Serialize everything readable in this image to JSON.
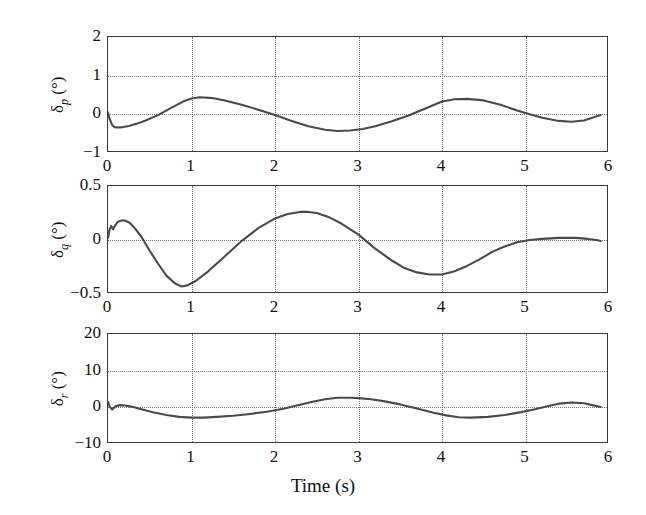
{
  "figure": {
    "background_color": "#ffffff",
    "line_color": "#4a4a4a",
    "axis_color": "#3a3a3a",
    "grid_color": "#777777",
    "xlabel": "Time (s)"
  },
  "chart_data": [
    {
      "type": "line",
      "title": "",
      "xlabel": "",
      "ylabel": "δ_p (°)",
      "ylabel_symbol": "δ",
      "ylabel_subscript": "p",
      "ylabel_unit": "(°)",
      "xlim": [
        0,
        6
      ],
      "ylim": [
        -1,
        2
      ],
      "xticks": [
        0,
        1,
        2,
        3,
        4,
        5,
        6
      ],
      "yticks": [
        -1,
        0,
        1,
        2
      ],
      "xticklabels": [
        "0",
        "1",
        "2",
        "3",
        "4",
        "5",
        "6"
      ],
      "yticklabels": [
        "-1",
        "0",
        "1",
        "2"
      ],
      "grid": true,
      "legend": false,
      "series": [
        {
          "name": "δ_p",
          "x": [
            0.0,
            0.02,
            0.05,
            0.08,
            0.12,
            0.18,
            0.25,
            0.35,
            0.45,
            0.6,
            0.75,
            0.9,
            1.0,
            1.1,
            1.25,
            1.4,
            1.6,
            1.8,
            2.0,
            2.2,
            2.4,
            2.6,
            2.75,
            2.9,
            3.05,
            3.2,
            3.4,
            3.6,
            3.8,
            4.0,
            4.15,
            4.3,
            4.5,
            4.7,
            4.9,
            5.05,
            5.2,
            5.4,
            5.55,
            5.7,
            5.8,
            5.9
          ],
          "y": [
            0.05,
            -0.12,
            -0.28,
            -0.33,
            -0.34,
            -0.33,
            -0.3,
            -0.24,
            -0.16,
            -0.02,
            0.16,
            0.33,
            0.41,
            0.44,
            0.42,
            0.36,
            0.25,
            0.12,
            -0.02,
            -0.17,
            -0.31,
            -0.4,
            -0.43,
            -0.42,
            -0.38,
            -0.31,
            -0.18,
            -0.03,
            0.15,
            0.33,
            0.39,
            0.4,
            0.36,
            0.25,
            0.1,
            0.0,
            -0.09,
            -0.17,
            -0.19,
            -0.16,
            -0.09,
            -0.02
          ]
        }
      ]
    },
    {
      "type": "line",
      "title": "",
      "xlabel": "",
      "ylabel": "δ_q (°)",
      "ylabel_symbol": "δ",
      "ylabel_subscript": "q",
      "ylabel_unit": "(°)",
      "xlim": [
        0,
        6
      ],
      "ylim": [
        -0.5,
        0.5
      ],
      "xticks": [
        0,
        1,
        2,
        3,
        4,
        5,
        6
      ],
      "yticks": [
        -0.5,
        0,
        0.5
      ],
      "xticklabels": [
        "0",
        "1",
        "2",
        "3",
        "4",
        "5",
        "6"
      ],
      "yticklabels": [
        "-0.5",
        "0",
        "0.5"
      ],
      "grid": true,
      "legend": false,
      "series": [
        {
          "name": "δ_q",
          "x": [
            0.0,
            0.02,
            0.04,
            0.06,
            0.09,
            0.12,
            0.16,
            0.2,
            0.26,
            0.32,
            0.4,
            0.5,
            0.6,
            0.7,
            0.8,
            0.88,
            0.95,
            1.05,
            1.2,
            1.4,
            1.6,
            1.8,
            2.0,
            2.15,
            2.3,
            2.4,
            2.5,
            2.65,
            2.8,
            3.0,
            3.2,
            3.4,
            3.55,
            3.7,
            3.85,
            4.0,
            4.15,
            4.3,
            4.45,
            4.6,
            4.75,
            4.9,
            5.05,
            5.2,
            5.4,
            5.6,
            5.75,
            5.85,
            5.9
          ],
          "y": [
            0.02,
            0.1,
            0.13,
            0.1,
            0.14,
            0.17,
            0.18,
            0.18,
            0.16,
            0.11,
            0.03,
            -0.1,
            -0.22,
            -0.33,
            -0.4,
            -0.43,
            -0.42,
            -0.38,
            -0.29,
            -0.15,
            -0.01,
            0.11,
            0.2,
            0.24,
            0.26,
            0.26,
            0.25,
            0.21,
            0.15,
            0.05,
            -0.08,
            -0.19,
            -0.26,
            -0.3,
            -0.32,
            -0.32,
            -0.29,
            -0.24,
            -0.18,
            -0.11,
            -0.06,
            -0.02,
            0.0,
            0.01,
            0.02,
            0.02,
            0.01,
            0.0,
            -0.01
          ]
        }
      ]
    },
    {
      "type": "line",
      "title": "",
      "xlabel": "Time (s)",
      "ylabel": "δ_r (°)",
      "ylabel_symbol": "δ",
      "ylabel_subscript": "r",
      "ylabel_unit": "(°)",
      "xlim": [
        0,
        6
      ],
      "ylim": [
        -10,
        20
      ],
      "xticks": [
        0,
        1,
        2,
        3,
        4,
        5,
        6
      ],
      "yticks": [
        -10,
        0,
        10,
        20
      ],
      "xticklabels": [
        "0",
        "1",
        "2",
        "3",
        "4",
        "5",
        "6"
      ],
      "yticklabels": [
        "-10",
        "0",
        "10",
        "20"
      ],
      "grid": true,
      "legend": false,
      "series": [
        {
          "name": "δ_r",
          "x": [
            0.0,
            0.02,
            0.05,
            0.09,
            0.14,
            0.2,
            0.28,
            0.4,
            0.55,
            0.7,
            0.85,
            1.0,
            1.15,
            1.3,
            1.5,
            1.7,
            1.9,
            2.1,
            2.3,
            2.45,
            2.6,
            2.75,
            2.9,
            3.0,
            3.15,
            3.3,
            3.5,
            3.7,
            3.9,
            4.05,
            4.2,
            4.35,
            4.55,
            4.75,
            4.95,
            5.1,
            5.25,
            5.4,
            5.55,
            5.7,
            5.8,
            5.9
          ],
          "y": [
            1.5,
            0.2,
            -0.6,
            0.3,
            0.6,
            0.5,
            0.2,
            -0.5,
            -1.4,
            -2.1,
            -2.6,
            -2.8,
            -2.8,
            -2.6,
            -2.3,
            -1.8,
            -1.2,
            -0.4,
            0.7,
            1.5,
            2.2,
            2.6,
            2.6,
            2.5,
            2.2,
            1.7,
            0.8,
            -0.3,
            -1.5,
            -2.2,
            -2.7,
            -2.8,
            -2.6,
            -2.1,
            -1.3,
            -0.6,
            0.2,
            1.0,
            1.3,
            1.1,
            0.6,
            0.1
          ]
        }
      ]
    }
  ],
  "panels": [
    {
      "id": "delta-p",
      "box": {
        "left": 107,
        "top": 36,
        "width": 501,
        "height": 116
      }
    },
    {
      "id": "delta-q",
      "box": {
        "left": 107,
        "top": 185,
        "width": 501,
        "height": 108
      }
    },
    {
      "id": "delta-r",
      "box": {
        "left": 107,
        "top": 333,
        "width": 501,
        "height": 110
      }
    }
  ]
}
